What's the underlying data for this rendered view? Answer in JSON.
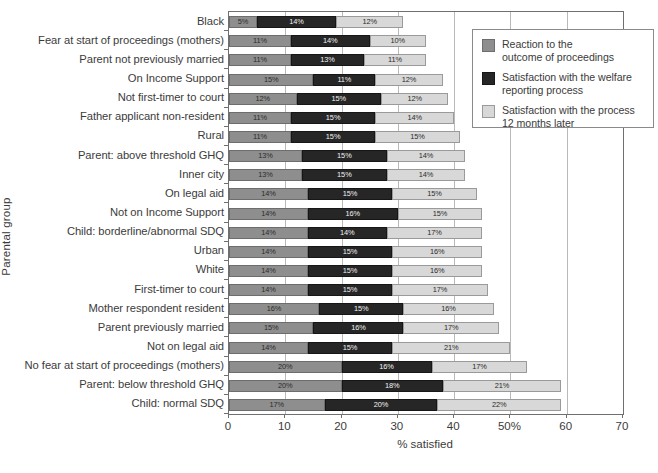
{
  "chart_data": {
    "type": "bar",
    "orientation": "horizontal",
    "stacked": true,
    "title": "",
    "xlabel": "% satisfied",
    "ylabel": "Parental group",
    "xlim": [
      0,
      70
    ],
    "xticks": [
      "0",
      "10",
      "20",
      "30",
      "40",
      "50%",
      "60",
      "70"
    ],
    "xtick_values": [
      0,
      10,
      20,
      30,
      40,
      50,
      60,
      70
    ],
    "grid": true,
    "grid_axis": "x",
    "legend_position": "top-right",
    "categories": [
      "Black",
      "Fear at start of proceedings (mothers)",
      "Parent not previously married",
      "On Income Support",
      "Not first-timer to court",
      "Father applicant non-resident",
      "Rural",
      "Parent: above threshold GHQ",
      "Inner city",
      "On legal aid",
      "Not on Income Support",
      "Child: borderline/abnormal SDQ",
      "Urban",
      "White",
      "First-timer to court",
      "Mother respondent resident",
      "Parent previously married",
      "Not on legal aid",
      "No fear at start of proceedings (mothers)",
      "Parent: below threshold GHQ",
      "Child: normal SDQ"
    ],
    "series": [
      {
        "name": "Reaction to the\noutcome of proceedings",
        "color": "#8e8e8e",
        "values": [
          5,
          11,
          11,
          15,
          12,
          11,
          11,
          13,
          13,
          14,
          14,
          14,
          14,
          14,
          14,
          16,
          15,
          14,
          20,
          20,
          17
        ],
        "labels": [
          "5%",
          "11%",
          "11%",
          "15%",
          "12%",
          "11%",
          "11%",
          "13%",
          "13%",
          "14%",
          "14%",
          "14%",
          "14%",
          "14%",
          "14%",
          "16%",
          "15%",
          "14%",
          "20%",
          "20%",
          "17%"
        ]
      },
      {
        "name": "Satisfaction with the welfare\nreporting process",
        "color": "#262626",
        "values": [
          14,
          14,
          13,
          11,
          15,
          15,
          15,
          15,
          15,
          15,
          16,
          14,
          15,
          15,
          15,
          15,
          16,
          15,
          16,
          18,
          20
        ],
        "labels": [
          "14%",
          "14%",
          "13%",
          "11%",
          "15%",
          "15%",
          "15%",
          "15%",
          "15%",
          "15%",
          "16%",
          "14%",
          "15%",
          "15%",
          "15%",
          "15%",
          "16%",
          "15%",
          "16%",
          "18%",
          "20%"
        ]
      },
      {
        "name": "Satisfaction with the process\n12 months later",
        "color": "#d8d8d8",
        "values": [
          12,
          10,
          11,
          12,
          12,
          14,
          15,
          14,
          14,
          15,
          15,
          17,
          16,
          16,
          17,
          16,
          17,
          21,
          17,
          21,
          22
        ],
        "labels": [
          "12%",
          "10%",
          "11%",
          "12%",
          "12%",
          "14%",
          "15%",
          "14%",
          "14%",
          "15%",
          "15%",
          "17%",
          "16%",
          "16%",
          "17%",
          "16%",
          "17%",
          "21%",
          "17%",
          "21%",
          "22%"
        ]
      }
    ]
  },
  "legend": {
    "entries": [
      {
        "label": "Reaction to the\noutcome of proceedings",
        "color": "#8e8e8e"
      },
      {
        "label": "Satisfaction with the welfare\nreporting process",
        "color": "#262626"
      },
      {
        "label": "Satisfaction with the process\n12 months later",
        "color": "#d8d8d8"
      }
    ]
  }
}
